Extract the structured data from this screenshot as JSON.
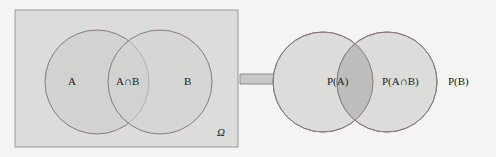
{
  "left_diagram": {
    "labels": {
      "a": "A",
      "intersection": "A∩B",
      "b": "B",
      "universe": "Ω"
    },
    "colors": {
      "box_fill": "#dcdcda",
      "box_stroke": "#9a9a98",
      "circle_fill": "#d0d0ce",
      "circle_stroke": "#8a7a7a"
    }
  },
  "arrow": {
    "color": "#c8c8c6",
    "stroke": "#8e8e8c"
  },
  "right_diagram": {
    "labels": {
      "a": "P(A)",
      "intersection": "P(A∩B)",
      "b": "P(B)"
    },
    "colors": {
      "circle_fill": "#dcdcda",
      "intersection_fill": "#bdbdbb",
      "circle_stroke": "#8a7a7a"
    }
  }
}
